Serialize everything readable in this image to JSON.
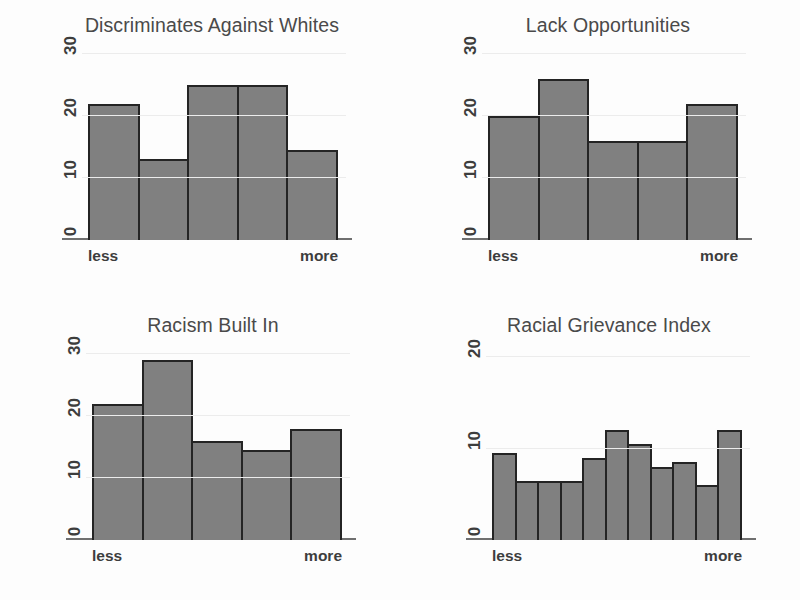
{
  "figure": {
    "background": "#fdfdfd",
    "bar_fill": "#808080",
    "bar_border": "#242424",
    "axis_color": "#6f6f6f"
  },
  "panels": [
    {
      "title": "Discriminates Against Whites",
      "xlabel_left": "less",
      "xlabel_right": "more",
      "yticks": [
        "30",
        "20",
        "10",
        "0"
      ]
    },
    {
      "title": "Lack Opportunities",
      "xlabel_left": "less",
      "xlabel_right": "more",
      "yticks": [
        "30",
        "20",
        "10",
        "0"
      ]
    },
    {
      "title": "Racism Built In",
      "xlabel_left": "less",
      "xlabel_right": "more",
      "yticks": [
        "30",
        "20",
        "10",
        "0"
      ]
    },
    {
      "title": "Racial Grievance Index",
      "xlabel_left": "less",
      "xlabel_right": "more",
      "yticks": [
        "20",
        "10",
        "0"
      ]
    }
  ],
  "chart_data": [
    {
      "type": "bar",
      "title": "Discriminates Against Whites",
      "xlabel": "",
      "ylabel": "",
      "categories": [
        "1",
        "2",
        "3",
        "4",
        "5"
      ],
      "tick_labels_x": [
        "less",
        "more"
      ],
      "values": [
        22,
        13,
        25,
        25,
        14.5
      ],
      "ylim": [
        0,
        31
      ],
      "yticks": [
        0,
        10,
        20,
        30
      ],
      "grid": true,
      "legend": "none"
    },
    {
      "type": "bar",
      "title": "Lack Opportunities",
      "xlabel": "",
      "ylabel": "",
      "categories": [
        "1",
        "2",
        "3",
        "4",
        "5"
      ],
      "tick_labels_x": [
        "less",
        "more"
      ],
      "values": [
        20,
        26,
        16,
        16,
        22
      ],
      "ylim": [
        0,
        31
      ],
      "yticks": [
        0,
        10,
        20,
        30
      ],
      "grid": true,
      "legend": "none"
    },
    {
      "type": "bar",
      "title": "Racism Built In",
      "xlabel": "",
      "ylabel": "",
      "categories": [
        "1",
        "2",
        "3",
        "4",
        "5"
      ],
      "tick_labels_x": [
        "less",
        "more"
      ],
      "values": [
        22,
        29,
        16,
        14.5,
        18
      ],
      "ylim": [
        0,
        31
      ],
      "yticks": [
        0,
        10,
        20,
        30
      ],
      "grid": true,
      "legend": "none"
    },
    {
      "type": "bar",
      "title": "Racial Grievance Index",
      "xlabel": "",
      "ylabel": "",
      "categories": [
        "1",
        "2",
        "3",
        "4",
        "5",
        "6",
        "7",
        "8",
        "9",
        "10",
        "11"
      ],
      "tick_labels_x": [
        "less",
        "more"
      ],
      "values": [
        9.5,
        6.5,
        6.5,
        6.5,
        9,
        12,
        10.5,
        8,
        8.5,
        6,
        12
      ],
      "ylim": [
        0,
        21
      ],
      "yticks": [
        0,
        10,
        20
      ],
      "grid": true,
      "legend": "none"
    }
  ]
}
